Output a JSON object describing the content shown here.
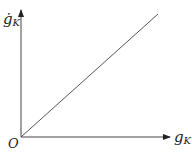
{
  "diagram": {
    "y_axis_label": "ġ",
    "y_axis_subscript": "K",
    "x_axis_label": "g",
    "x_axis_subscript": "K",
    "origin_label": "O",
    "line": {
      "type": "linear",
      "from": "origin",
      "direction": "increasing"
    }
  }
}
